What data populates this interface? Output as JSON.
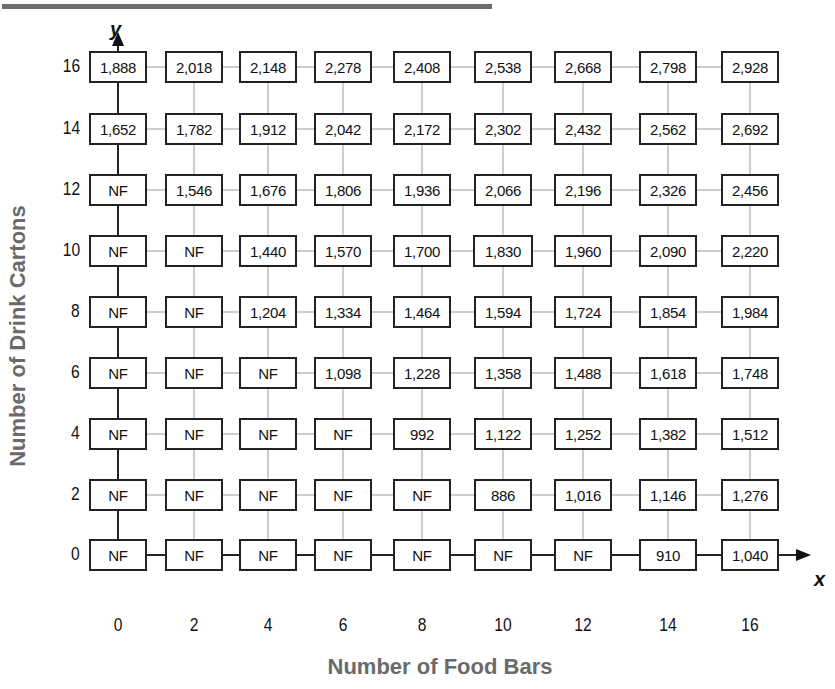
{
  "chart_data": {
    "type": "table",
    "title": "",
    "xlabel": "Number of Food Bars",
    "ylabel": "Number of Drink Cartons",
    "x_axis_letter": "x",
    "y_axis_letter": "y",
    "x": [
      0,
      2,
      4,
      6,
      8,
      10,
      12,
      14,
      16
    ],
    "y": [
      16,
      14,
      12,
      10,
      8,
      6,
      4,
      2,
      0
    ],
    "x_tick_labels": [
      "0",
      "2",
      "4",
      "6",
      "8",
      "10",
      "12",
      "14",
      "16"
    ],
    "y_tick_labels": [
      "16",
      "14",
      "12",
      "10",
      "8",
      "6",
      "4",
      "2",
      "0"
    ],
    "grid": true,
    "legend": "none",
    "cells": [
      [
        "1,888",
        "2,018",
        "2,148",
        "2,278",
        "2,408",
        "2,538",
        "2,668",
        "2,798",
        "2,928"
      ],
      [
        "1,652",
        "1,782",
        "1,912",
        "2,042",
        "2,172",
        "2,302",
        "2,432",
        "2,562",
        "2,692"
      ],
      [
        "NF",
        "1,546",
        "1,676",
        "1,806",
        "1,936",
        "2,066",
        "2,196",
        "2,326",
        "2,456"
      ],
      [
        "NF",
        "NF",
        "1,440",
        "1,570",
        "1,700",
        "1,830",
        "1,960",
        "2,090",
        "2,220"
      ],
      [
        "NF",
        "NF",
        "1,204",
        "1,334",
        "1,464",
        "1,594",
        "1,724",
        "1,854",
        "1,984"
      ],
      [
        "NF",
        "NF",
        "NF",
        "1,098",
        "1,228",
        "1,358",
        "1,488",
        "1,618",
        "1,748"
      ],
      [
        "NF",
        "NF",
        "NF",
        "NF",
        "992",
        "1,122",
        "1,252",
        "1,382",
        "1,512"
      ],
      [
        "NF",
        "NF",
        "NF",
        "NF",
        "NF",
        "886",
        "1,016",
        "1,146",
        "1,276"
      ],
      [
        "NF",
        "NF",
        "NF",
        "NF",
        "NF",
        "NF",
        "NF",
        "910",
        "1,040"
      ]
    ],
    "values_note": "NF = not feasible"
  },
  "colors": {
    "axis_title": "#6a6a6a",
    "grid_line": "#bdbdbd",
    "box_border": "#222222",
    "top_rule": "#6e6e6e"
  }
}
